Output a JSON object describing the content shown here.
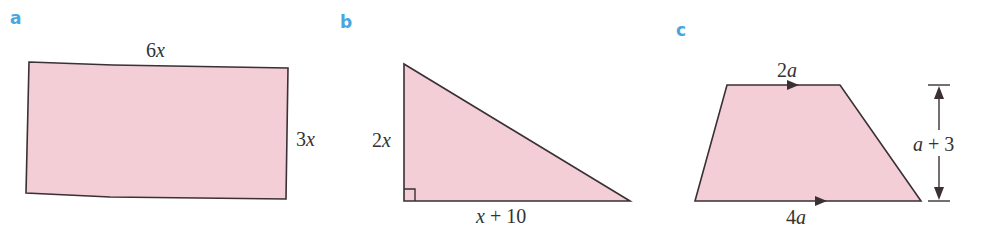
{
  "figures": [
    {
      "id": "a",
      "label": "a",
      "shape": "rectangle",
      "top_side": {
        "coef": "6",
        "var": "x"
      },
      "right_side": {
        "coef": "3",
        "var": "x"
      }
    },
    {
      "id": "b",
      "label": "b",
      "shape": "right-triangle",
      "left_side": {
        "coef": "2",
        "var": "x"
      },
      "base": {
        "var": "x",
        "rest": " + 10"
      }
    },
    {
      "id": "c",
      "label": "c",
      "shape": "trapezium",
      "top_side": {
        "coef": "2",
        "var": "a"
      },
      "bottom_side": {
        "coef": "4",
        "var": "a"
      },
      "height": {
        "var": "a",
        "rest": " + 3"
      }
    }
  ],
  "colors": {
    "label": "#4aa6e0",
    "fill": "#f3ced6",
    "stroke": "#3a3035"
  }
}
